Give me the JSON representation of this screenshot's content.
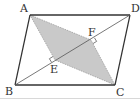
{
  "figure": {
    "type": "parallelogram-geometry",
    "colors": {
      "stroke": "#333333",
      "shade": "#c9c9c9",
      "diagonal": "#555555",
      "background": "#ffffff"
    },
    "points": {
      "A": {
        "label": "A",
        "x": 30,
        "y": 15
      },
      "B": {
        "label": "B",
        "x": 15,
        "y": 85
      },
      "C": {
        "label": "C",
        "x": 115,
        "y": 85
      },
      "D": {
        "label": "D",
        "x": 130,
        "y": 15
      },
      "E": {
        "label": "E",
        "x": 55,
        "y": 60
      },
      "F": {
        "label": "F",
        "x": 91,
        "y": 40
      }
    },
    "segments": [
      "AB",
      "BC",
      "CD",
      "DA",
      "BD"
    ],
    "shaded_region": [
      "A",
      "F",
      "C",
      "E"
    ],
    "right_angles": [
      "E",
      "F"
    ]
  }
}
